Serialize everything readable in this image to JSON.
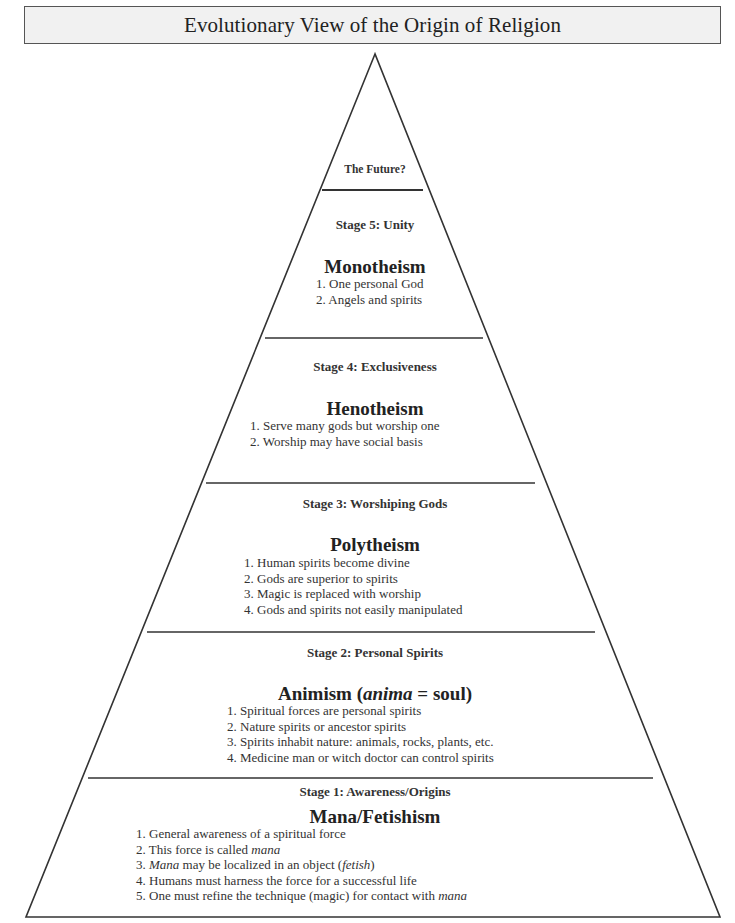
{
  "title": "Evolutionary View of the Origin of Religion",
  "top": {
    "label": "The Future?"
  },
  "stages": [
    {
      "stage": "Stage 5: Unity",
      "name": "Monotheism",
      "items": [
        "1. One personal God",
        "2. Angels and spirits"
      ]
    },
    {
      "stage": "Stage  4: Exclusiveness",
      "name": "Henotheism",
      "items": [
        "1. Serve many gods but worship one",
        "2. Worship may have social basis"
      ]
    },
    {
      "stage": "Stage 3: Worshiping Gods",
      "name": "Polytheism",
      "items": [
        "1. Human spirits become divine",
        "2. Gods are superior to spirits",
        "3. Magic is replaced with worship",
        "4. Gods and spirits not easily manipulated"
      ]
    },
    {
      "stage": "Stage 2: Personal Spirits",
      "name_prefix": "Animism (",
      "name_italic": "anima",
      "name_suffix": " = soul)",
      "items": [
        "1. Spiritual forces are personal spirits",
        "2. Nature spirits or ancestor spirits",
        "3. Spirits inhabit nature: animals, rocks, plants, etc.",
        "4. Medicine man or witch doctor can control spirits"
      ]
    },
    {
      "stage": "Stage 1: Awareness/Origins",
      "name": "Mana/Fetishism",
      "items": [
        {
          "pre": "1. General awareness of a spiritual force"
        },
        {
          "pre": "2. This force is called ",
          "it": "mana"
        },
        {
          "pre": "3. ",
          "it": "Mana",
          "post": " may be localized in an object (",
          "it2": "fetish",
          "post2": ")"
        },
        {
          "pre": "4. Humans must harness the force for a successful life"
        },
        {
          "pre": "5. One must refine the technique (magic) for contact with ",
          "it": "mana"
        }
      ]
    }
  ],
  "colors": {
    "line": "#333333",
    "title_bg": "#f1f1f1",
    "title_border": "#555555"
  }
}
